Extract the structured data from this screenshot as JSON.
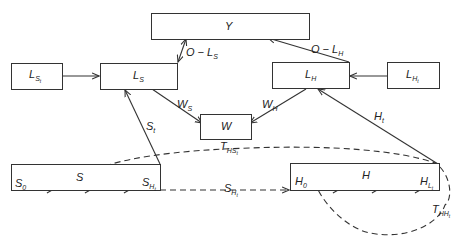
{
  "diagram": {
    "nodes": {
      "Y": {
        "label": "Y"
      },
      "LS": {
        "label": "L",
        "sub": "S"
      },
      "LSt": {
        "label": "L",
        "sub": "S",
        "subsub": "t"
      },
      "LH": {
        "label": "L",
        "sub": "H"
      },
      "LHt": {
        "label": "L",
        "sub": "H",
        "subsub": "t"
      },
      "W": {
        "label": "W"
      },
      "S_stock": {
        "s0": "S",
        "s0sub": "0",
        "s": "S",
        "sH": "S",
        "sHsub": "H",
        "sHsubsub": "t"
      },
      "H_stock": {
        "h0": "H",
        "h0sub": "0",
        "h": "H",
        "hL": "H",
        "hLsub": "L",
        "hLsubsub": "t"
      }
    },
    "edges": {
      "O_LS": {
        "label": "O − L",
        "sub": "S"
      },
      "O_LH": {
        "label": "O − L",
        "sub": "H"
      },
      "WS": {
        "label": "W",
        "sub": "S"
      },
      "WH": {
        "label": "W",
        "sub": "H"
      },
      "St": {
        "label": "S",
        "sub": "t"
      },
      "Ht": {
        "label": "H",
        "sub": "t"
      },
      "THS": {
        "label": "T",
        "sub": "HS",
        "subsub": "t"
      },
      "SH": {
        "label": "S",
        "sub": "H",
        "subsub": "t"
      },
      "THH": {
        "label": "T",
        "sub": "HH",
        "subsub": "t"
      }
    }
  }
}
